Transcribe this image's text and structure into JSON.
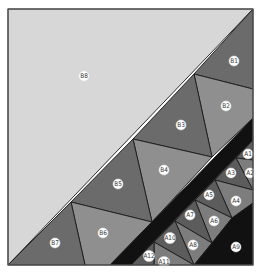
{
  "diagram": {
    "frame": {
      "x": 8,
      "y": 9,
      "w": 245,
      "h": 256
    },
    "colors": {
      "light": "#d7d7d7",
      "dark": "#6b6b6b",
      "medium": "#8f8f8f",
      "black": "#111111",
      "a_dark": "#5c5c5c",
      "a_medium": "#7d7d7d"
    },
    "pieces": [
      {
        "id": "B8",
        "fill": "light",
        "points": "8,9 253,9 8,265",
        "label": {
          "text": "B8",
          "x": 84,
          "y": 76
        }
      },
      {
        "id": "B1",
        "fill": "dark",
        "points": "253,9 253,89 194,74",
        "label": {
          "text": "B1",
          "x": 234,
          "y": 61
        }
      },
      {
        "id": "B2",
        "fill": "medium",
        "points": "194,74 253,89 253,118 212,157",
        "label": {
          "text": "B2",
          "x": 226,
          "y": 106
        }
      },
      {
        "id": "B3",
        "fill": "dark",
        "points": "194,74 212,157 133,139",
        "label": {
          "text": "B3",
          "x": 181,
          "y": 125
        }
      },
      {
        "id": "B4",
        "fill": "medium",
        "points": "133,139 212,157 152,222",
        "label": {
          "text": "B4",
          "x": 164,
          "y": 170
        }
      },
      {
        "id": "B5",
        "fill": "dark",
        "points": "133,139 152,222 71,202",
        "label": {
          "text": "B5",
          "x": 118,
          "y": 184
        }
      },
      {
        "id": "B6",
        "fill": "medium",
        "points": "71,202 152,222 110,265 85,265",
        "label": {
          "text": "B6",
          "x": 103,
          "y": 233
        }
      },
      {
        "id": "B7",
        "fill": "dark",
        "points": "71,202 85,265 8,265",
        "label": {
          "text": "B7",
          "x": 55,
          "y": 243
        }
      },
      {
        "id": "BAND",
        "fill": "black",
        "points": "253,118 253,140 131,265 110,265",
        "label": null
      },
      {
        "id": "A1",
        "fill": "a_dark",
        "points": "253,140 253,160 236,158",
        "label": {
          "text": "A1",
          "x": 248,
          "y": 154
        }
      },
      {
        "id": "A2",
        "fill": "a_medium",
        "points": "236,158 253,160 253,190",
        "label": {
          "text": "A2",
          "x": 250,
          "y": 173
        }
      },
      {
        "id": "A3",
        "fill": "a_dark",
        "points": "236,158 253,190 215,180",
        "label": {
          "text": "A3",
          "x": 231,
          "y": 173
        }
      },
      {
        "id": "A4",
        "fill": "a_medium",
        "points": "215,180 253,190 253,203 232,218",
        "label": {
          "text": "A4",
          "x": 236,
          "y": 201
        }
      },
      {
        "id": "A5",
        "fill": "a_dark",
        "points": "215,180 232,218 195,200",
        "label": {
          "text": "A5",
          "x": 209,
          "y": 195
        }
      },
      {
        "id": "A6",
        "fill": "a_medium",
        "points": "195,200 232,218 212,243",
        "label": {
          "text": "A6",
          "x": 214,
          "y": 221
        }
      },
      {
        "id": "A7",
        "fill": "a_dark",
        "points": "195,200 212,243 175,221",
        "label": {
          "text": "A7",
          "x": 190,
          "y": 215
        }
      },
      {
        "id": "A8",
        "fill": "a_medium",
        "points": "175,221 212,243 194,265",
        "label": {
          "text": "A8",
          "x": 193,
          "y": 245
        }
      },
      {
        "id": "A10",
        "fill": "a_dark",
        "points": "175,221 194,265 154,242",
        "label": {
          "text": "A10",
          "x": 170,
          "y": 238
        }
      },
      {
        "id": "A11",
        "fill": "a_medium",
        "points": "154,242 194,265 154,265",
        "label": {
          "text": "A11",
          "x": 164,
          "y": 262
        }
      },
      {
        "id": "A12",
        "fill": "a_dark",
        "points": "154,242 154,265 131,265",
        "label": {
          "text": "A12",
          "x": 149,
          "y": 256
        }
      },
      {
        "id": "A9",
        "fill": "black",
        "points": "253,203 253,265 194,265 212,243 232,218",
        "label": {
          "text": "A9",
          "x": 236,
          "y": 247
        }
      }
    ]
  }
}
